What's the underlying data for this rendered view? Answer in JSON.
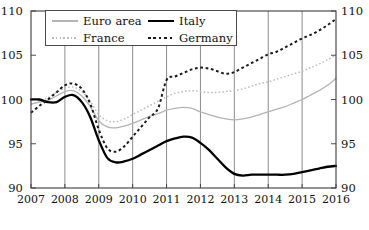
{
  "chart_data": {
    "type": "line",
    "title": "",
    "subtitle": "",
    "xlabel": "",
    "ylabel": "",
    "xlim": [
      2007.0,
      2016.0
    ],
    "ylim": [
      90,
      110
    ],
    "yticks": [
      90,
      95,
      100,
      105,
      110
    ],
    "ytick_labels_left": [
      "90",
      "95",
      "100",
      "105",
      "110"
    ],
    "ytick_labels_right": [
      "90",
      "95",
      "100",
      "105",
      "110"
    ],
    "xticks": [
      2007,
      2008,
      2009,
      2010,
      2011,
      2012,
      2013,
      2014,
      2015,
      2016
    ],
    "xtick_labels": [
      "2007",
      "2008",
      "2009",
      "2010",
      "2011",
      "2012",
      "2013",
      "2014",
      "2015",
      "2016"
    ],
    "grid": "vertical-only",
    "legend_position": "upper-left-inside",
    "y_axis_both_sides": true,
    "series": [
      {
        "name": "Euro area",
        "color": "#b4b4b4",
        "style": "solid",
        "width": 1.3,
        "points": [
          [
            2007.0,
            99.5
          ],
          [
            2007.25,
            99.7
          ],
          [
            2007.5,
            99.9
          ],
          [
            2007.75,
            100.4
          ],
          [
            2008.0,
            100.9
          ],
          [
            2008.25,
            101.0
          ],
          [
            2008.5,
            100.4
          ],
          [
            2008.75,
            99.2
          ],
          [
            2009.0,
            97.6
          ],
          [
            2009.25,
            96.9
          ],
          [
            2009.5,
            96.8
          ],
          [
            2009.75,
            97.0
          ],
          [
            2010.0,
            97.3
          ],
          [
            2010.25,
            97.7
          ],
          [
            2010.5,
            98.1
          ],
          [
            2010.75,
            98.4
          ],
          [
            2011.0,
            98.8
          ],
          [
            2011.25,
            99.0
          ],
          [
            2011.5,
            99.1
          ],
          [
            2011.75,
            99.0
          ],
          [
            2012.0,
            98.6
          ],
          [
            2012.25,
            98.3
          ],
          [
            2012.5,
            98.0
          ],
          [
            2012.75,
            97.8
          ],
          [
            2013.0,
            97.7
          ],
          [
            2013.25,
            97.8
          ],
          [
            2013.5,
            98.0
          ],
          [
            2013.75,
            98.3
          ],
          [
            2014.0,
            98.6
          ],
          [
            2014.25,
            98.9
          ],
          [
            2014.5,
            99.2
          ],
          [
            2014.75,
            99.6
          ],
          [
            2015.0,
            100.0
          ],
          [
            2015.25,
            100.5
          ],
          [
            2015.5,
            101.0
          ],
          [
            2015.75,
            101.6
          ],
          [
            2016.0,
            102.4
          ]
        ]
      },
      {
        "name": "France",
        "color": "#bdbdbd",
        "style": "dotted",
        "width": 1.5,
        "points": [
          [
            2007.0,
            99.4
          ],
          [
            2007.25,
            99.8
          ],
          [
            2007.5,
            100.2
          ],
          [
            2007.75,
            100.8
          ],
          [
            2008.0,
            101.3
          ],
          [
            2008.25,
            101.4
          ],
          [
            2008.5,
            100.9
          ],
          [
            2008.75,
            99.8
          ],
          [
            2009.0,
            98.3
          ],
          [
            2009.25,
            97.6
          ],
          [
            2009.5,
            97.5
          ],
          [
            2009.75,
            97.8
          ],
          [
            2010.0,
            98.3
          ],
          [
            2010.25,
            98.8
          ],
          [
            2010.5,
            99.3
          ],
          [
            2010.75,
            99.8
          ],
          [
            2011.0,
            100.3
          ],
          [
            2011.25,
            100.7
          ],
          [
            2011.5,
            100.9
          ],
          [
            2011.75,
            101.0
          ],
          [
            2012.0,
            100.9
          ],
          [
            2012.25,
            100.8
          ],
          [
            2012.5,
            100.8
          ],
          [
            2012.75,
            100.9
          ],
          [
            2013.0,
            101.0
          ],
          [
            2013.25,
            101.2
          ],
          [
            2013.5,
            101.5
          ],
          [
            2013.75,
            101.8
          ],
          [
            2014.0,
            102.0
          ],
          [
            2014.25,
            102.3
          ],
          [
            2014.5,
            102.6
          ],
          [
            2014.75,
            102.9
          ],
          [
            2015.0,
            103.2
          ],
          [
            2015.25,
            103.6
          ],
          [
            2015.5,
            104.0
          ],
          [
            2015.75,
            104.5
          ],
          [
            2016.0,
            105.0
          ]
        ]
      },
      {
        "name": "Italy",
        "color": "#000000",
        "style": "solid",
        "width": 2.3,
        "points": [
          [
            2007.0,
            100.0
          ],
          [
            2007.25,
            100.0
          ],
          [
            2007.5,
            99.7
          ],
          [
            2007.75,
            99.7
          ],
          [
            2008.0,
            100.3
          ],
          [
            2008.25,
            100.5
          ],
          [
            2008.5,
            99.7
          ],
          [
            2008.75,
            98.0
          ],
          [
            2009.0,
            95.4
          ],
          [
            2009.25,
            93.4
          ],
          [
            2009.5,
            92.9
          ],
          [
            2009.75,
            93.0
          ],
          [
            2010.0,
            93.3
          ],
          [
            2010.25,
            93.8
          ],
          [
            2010.5,
            94.3
          ],
          [
            2010.75,
            94.8
          ],
          [
            2011.0,
            95.3
          ],
          [
            2011.25,
            95.6
          ],
          [
            2011.5,
            95.8
          ],
          [
            2011.75,
            95.7
          ],
          [
            2012.0,
            95.1
          ],
          [
            2012.25,
            94.3
          ],
          [
            2012.5,
            93.3
          ],
          [
            2012.75,
            92.3
          ],
          [
            2013.0,
            91.6
          ],
          [
            2013.25,
            91.4
          ],
          [
            2013.5,
            91.5
          ],
          [
            2013.75,
            91.5
          ],
          [
            2014.0,
            91.5
          ],
          [
            2014.25,
            91.5
          ],
          [
            2014.5,
            91.5
          ],
          [
            2014.75,
            91.6
          ],
          [
            2015.0,
            91.8
          ],
          [
            2015.25,
            92.0
          ],
          [
            2015.5,
            92.2
          ],
          [
            2015.75,
            92.4
          ],
          [
            2016.0,
            92.5
          ]
        ]
      },
      {
        "name": "Germany",
        "color": "#1a1a1a",
        "style": "dashed",
        "width": 2.0,
        "points": [
          [
            2007.0,
            98.5
          ],
          [
            2007.25,
            99.3
          ],
          [
            2007.5,
            100.0
          ],
          [
            2007.75,
            100.8
          ],
          [
            2008.0,
            101.6
          ],
          [
            2008.25,
            101.8
          ],
          [
            2008.5,
            101.2
          ],
          [
            2008.75,
            99.5
          ],
          [
            2009.0,
            96.6
          ],
          [
            2009.25,
            94.5
          ],
          [
            2009.5,
            94.1
          ],
          [
            2009.75,
            94.7
          ],
          [
            2010.0,
            95.8
          ],
          [
            2010.25,
            96.9
          ],
          [
            2010.5,
            98.0
          ],
          [
            2010.75,
            99.0
          ],
          [
            2011.0,
            102.2
          ],
          [
            2011.25,
            102.6
          ],
          [
            2011.5,
            103.0
          ],
          [
            2011.75,
            103.4
          ],
          [
            2012.0,
            103.6
          ],
          [
            2012.25,
            103.5
          ],
          [
            2012.5,
            103.2
          ],
          [
            2012.75,
            102.9
          ],
          [
            2013.0,
            103.1
          ],
          [
            2013.25,
            103.6
          ],
          [
            2013.5,
            104.1
          ],
          [
            2013.75,
            104.6
          ],
          [
            2014.0,
            105.1
          ],
          [
            2014.25,
            105.4
          ],
          [
            2014.5,
            105.9
          ],
          [
            2014.75,
            106.4
          ],
          [
            2015.0,
            106.9
          ],
          [
            2015.25,
            107.3
          ],
          [
            2015.5,
            107.8
          ],
          [
            2015.75,
            108.4
          ],
          [
            2016.0,
            109.1
          ]
        ]
      }
    ]
  },
  "legend": {
    "entries": [
      {
        "label": "Euro area",
        "name": "euro-area"
      },
      {
        "label": "Italy",
        "name": "italy"
      },
      {
        "label": "France",
        "name": "france"
      },
      {
        "label": "Germany",
        "name": "germany"
      }
    ]
  }
}
